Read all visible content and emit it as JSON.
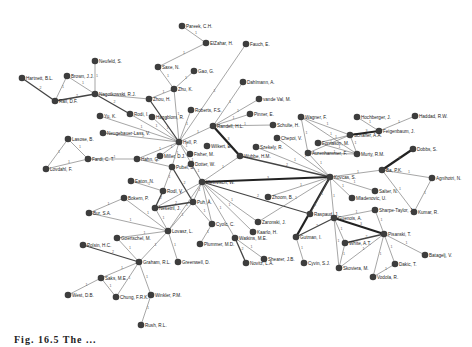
{
  "figure": {
    "caption": "Fig. 16.5  The ..."
  },
  "nodes": [
    {
      "id": "parest",
      "label": "Pareek, C.H.",
      "x": 182,
      "y": 26
    },
    {
      "id": "elzahar",
      "label": "ElZahar, H.",
      "x": 206,
      "y": 43
    },
    {
      "id": "fauch",
      "label": "Fauch, E.",
      "x": 246,
      "y": 44
    },
    {
      "id": "saxe",
      "label": "Saxe, N.",
      "x": 158,
      "y": 67
    },
    {
      "id": "gao",
      "label": "Gao, G.",
      "x": 194,
      "y": 71
    },
    {
      "id": "dahlmann",
      "label": "Dahlmann, A.",
      "x": 243,
      "y": 82
    },
    {
      "id": "vandevall",
      "label": "vande Val, M.",
      "x": 259,
      "y": 99
    },
    {
      "id": "neufeld",
      "label": "Neufeld, S.",
      "x": 95,
      "y": 61
    },
    {
      "id": "hartnett",
      "label": "Hartnett, B.L.",
      "x": 22,
      "y": 78
    },
    {
      "id": "brown",
      "label": "Brown, J.J.",
      "x": 67,
      "y": 76
    },
    {
      "id": "rail",
      "label": "Rail, D.F.",
      "x": 55,
      "y": 101
    },
    {
      "id": "nagoh",
      "label": "Nagotkowski, R.J.",
      "x": 95,
      "y": 94
    },
    {
      "id": "zhu",
      "label": "Zhu, K.",
      "x": 174,
      "y": 89
    },
    {
      "id": "zhou",
      "label": "Zhou, H.",
      "x": 149,
      "y": 99
    },
    {
      "id": "yu",
      "label": "Yu, K.",
      "x": 100,
      "y": 116
    },
    {
      "id": "rodi",
      "label": "Rodi, I.",
      "x": 130,
      "y": 114
    },
    {
      "id": "haggbloom",
      "label": "Haggblom, R.",
      "x": 152,
      "y": 117
    },
    {
      "id": "roberts",
      "label": "Roberts, F.S.",
      "x": 191,
      "y": 110
    },
    {
      "id": "pinner",
      "label": "Pinner, E.",
      "x": 250,
      "y": 114
    },
    {
      "id": "rainbold",
      "label": "Randell, H.L.",
      "x": 213,
      "y": 126
    },
    {
      "id": "schulte",
      "label": "Schulte, H.",
      "x": 273,
      "y": 125
    },
    {
      "id": "wagner",
      "label": "Wagner, F.",
      "x": 301,
      "y": 117
    },
    {
      "id": "hochberger",
      "label": "Hochberger, J.",
      "x": 357,
      "y": 117
    },
    {
      "id": "haddad",
      "label": "Haddad, R.W.",
      "x": 415,
      "y": 116
    },
    {
      "id": "feigenbaum",
      "label": "Feigenbaum, J.",
      "x": 379,
      "y": 131
    },
    {
      "id": "schaffer",
      "label": "Schaffer, A.A.",
      "x": 350,
      "y": 135
    },
    {
      "id": "fornason",
      "label": "Fornason, M.",
      "x": 318,
      "y": 143
    },
    {
      "id": "aurenhammer",
      "label": "Aurenhammer, F.",
      "x": 308,
      "y": 153
    },
    {
      "id": "murty",
      "label": "Murty, R.M.",
      "x": 357,
      "y": 154
    },
    {
      "id": "neugebauer",
      "label": "Neugebauer-Lass, V.",
      "x": 103,
      "y": 133
    },
    {
      "id": "hell",
      "label": "Hell, P.",
      "x": 179,
      "y": 142
    },
    {
      "id": "wilkert",
      "label": "Wilkert, E.",
      "x": 207,
      "y": 146
    },
    {
      "id": "chepoi",
      "label": "Chepoi, V.",
      "x": 277,
      "y": 138
    },
    {
      "id": "lasose",
      "label": "Lasose, B.",
      "x": 68,
      "y": 139
    },
    {
      "id": "fardi",
      "label": "Fardi, C. T.",
      "x": 88,
      "y": 159
    },
    {
      "id": "hahn",
      "label": "Hahn, G.",
      "x": 137,
      "y": 159
    },
    {
      "id": "miller",
      "label": "Miller, D.J.",
      "x": 160,
      "y": 156
    },
    {
      "id": "fisher",
      "label": "Fisher, M.",
      "x": 190,
      "y": 154
    },
    {
      "id": "szekely",
      "label": "Szekely, R.",
      "x": 256,
      "y": 147
    },
    {
      "id": "wubbe",
      "label": "Wubbe, H.M.",
      "x": 240,
      "y": 156
    },
    {
      "id": "lovdahl",
      "label": "Lovdahl, F.",
      "x": 46,
      "y": 169
    },
    {
      "id": "pubel",
      "label": "Pubel, S.",
      "x": 172,
      "y": 167
    },
    {
      "id": "dotter",
      "label": "Dotter, W.",
      "x": 191,
      "y": 164
    },
    {
      "id": "kleinvisch",
      "label": "Kleinvisch, W.",
      "x": 202,
      "y": 182
    },
    {
      "id": "kovcas",
      "label": "Kovcas, S.",
      "x": 330,
      "y": 177
    },
    {
      "id": "ba",
      "label": "Ba, P.K.",
      "x": 382,
      "y": 170
    },
    {
      "id": "dobbs",
      "label": "Dobbs, S.",
      "x": 413,
      "y": 149
    },
    {
      "id": "agnihotri",
      "label": "Agnihotri, N.",
      "x": 432,
      "y": 178
    },
    {
      "id": "salter",
      "label": "Salter, N.",
      "x": 375,
      "y": 191
    },
    {
      "id": "mladenovic",
      "label": "Mladenovic, U.",
      "x": 352,
      "y": 198
    },
    {
      "id": "eaton",
      "label": "Eaton, N.",
      "x": 131,
      "y": 181
    },
    {
      "id": "rodl",
      "label": "Rodl, V.",
      "x": 163,
      "y": 191
    },
    {
      "id": "zhoom",
      "label": "Zhoom, B.",
      "x": 268,
      "y": 197
    },
    {
      "id": "boken",
      "label": "Bokern, P.",
      "x": 124,
      "y": 198
    },
    {
      "id": "puh",
      "label": "Puh, A.",
      "x": 193,
      "y": 202
    },
    {
      "id": "nesetril",
      "label": "Nesetril, J.",
      "x": 155,
      "y": 208
    },
    {
      "id": "raspaud",
      "label": "Raspaud, J.",
      "x": 310,
      "y": 214
    },
    {
      "id": "guenois",
      "label": "Guenois, A.",
      "x": 334,
      "y": 218
    },
    {
      "id": "sharpe",
      "label": "Sharpe-Taylor, J.",
      "x": 375,
      "y": 210
    },
    {
      "id": "kumar",
      "label": "Kumar, R.",
      "x": 414,
      "y": 212
    },
    {
      "id": "bur",
      "label": "Bur, S.A.",
      "x": 89,
      "y": 213
    },
    {
      "id": "lovasz",
      "label": "Lovasz, L.",
      "x": 168,
      "y": 231
    },
    {
      "id": "zaronski",
      "label": "Zaronski, J.",
      "x": 258,
      "y": 222
    },
    {
      "id": "cyolc",
      "label": "Cyolc, C.",
      "x": 212,
      "y": 224
    },
    {
      "id": "kaarlo",
      "label": "Kaarlo, H.",
      "x": 253,
      "y": 232
    },
    {
      "id": "gutman",
      "label": "Gutman, I.",
      "x": 296,
      "y": 237
    },
    {
      "id": "white",
      "label": "White, A.T.",
      "x": 345,
      "y": 243
    },
    {
      "id": "pisanski",
      "label": "Pisanski, T.",
      "x": 384,
      "y": 234
    },
    {
      "id": "goertschel",
      "label": "Goertschel, M.",
      "x": 117,
      "y": 238
    },
    {
      "id": "plummer",
      "label": "Plummer, M.D.",
      "x": 200,
      "y": 244
    },
    {
      "id": "watkins",
      "label": "Watkins, M.E.",
      "x": 235,
      "y": 238
    },
    {
      "id": "polsin",
      "label": "Polsin, H.C.",
      "x": 83,
      "y": 245
    },
    {
      "id": "graham",
      "label": "Graham, R.L.",
      "x": 139,
      "y": 262
    },
    {
      "id": "greenwell",
      "label": "Greenwell, D.",
      "x": 178,
      "y": 262
    },
    {
      "id": "shearer",
      "label": "Shearer, J.B.",
      "x": 264,
      "y": 259
    },
    {
      "id": "cyvin",
      "label": "Cyvin, S.J.",
      "x": 304,
      "y": 263
    },
    {
      "id": "skoviera",
      "label": "Skoviera, M.",
      "x": 339,
      "y": 268
    },
    {
      "id": "dakic",
      "label": "Dakic, T.",
      "x": 395,
      "y": 264
    },
    {
      "id": "batagelj",
      "label": "Batagelj, V.",
      "x": 425,
      "y": 255
    },
    {
      "id": "novitz",
      "label": "Novitz, L.A.",
      "x": 246,
      "y": 263
    },
    {
      "id": "saks",
      "label": "Saks, M.E.",
      "x": 101,
      "y": 278
    },
    {
      "id": "vodola",
      "label": "Vodola, R.",
      "x": 373,
      "y": 277
    },
    {
      "id": "chung",
      "label": "Chung, F.R.K.",
      "x": 116,
      "y": 297
    },
    {
      "id": "winkler",
      "label": "Winkler, P.M.",
      "x": 151,
      "y": 295
    },
    {
      "id": "west",
      "label": "West, D.B.",
      "x": 68,
      "y": 295
    },
    {
      "id": "rush",
      "label": "Rush, R.L.",
      "x": 141,
      "y": 325
    }
  ],
  "edges": [
    [
      "parest",
      "elzahar",
      1,
      "1"
    ],
    [
      "elzahar",
      "saxe",
      1,
      "1"
    ],
    [
      "saxe",
      "zhu",
      1,
      "1"
    ],
    [
      "gao",
      "zhu",
      1,
      "1"
    ],
    [
      "zhu",
      "zhou",
      1,
      "1"
    ],
    [
      "zhu",
      "hell",
      1,
      "1"
    ],
    [
      "zhou",
      "nagoh",
      1,
      "1"
    ],
    [
      "zhou",
      "hell",
      2,
      "2"
    ],
    [
      "neufeld",
      "nagoh",
      1,
      "1"
    ],
    [
      "brown",
      "nagoh",
      1,
      "1"
    ],
    [
      "brown",
      "rail",
      1,
      "1"
    ],
    [
      "hartnett",
      "rail",
      2,
      "2"
    ],
    [
      "rail",
      "nagoh",
      2,
      "2"
    ],
    [
      "nagoh",
      "rodi",
      2,
      "2"
    ],
    [
      "rodi",
      "hell",
      1,
      "1"
    ],
    [
      "yu",
      "hell",
      1,
      "1"
    ],
    [
      "haggbloom",
      "hell",
      1,
      "1"
    ],
    [
      "neugebauer",
      "hell",
      1,
      "1"
    ],
    [
      "roberts",
      "hell",
      1,
      "1"
    ],
    [
      "hell",
      "rainbold",
      1,
      "1"
    ],
    [
      "hell",
      "miller",
      1,
      "1"
    ],
    [
      "hell",
      "fisher",
      1,
      "1"
    ],
    [
      "hell",
      "hahn",
      1,
      "1"
    ],
    [
      "hell",
      "pubel",
      1,
      "1"
    ],
    [
      "hell",
      "kleinvisch",
      1,
      "1"
    ],
    [
      "fauch",
      "hell",
      1,
      "1"
    ],
    [
      "dahlmann",
      "rainbold",
      1,
      "1"
    ],
    [
      "vandevall",
      "rainbold",
      1,
      "1"
    ],
    [
      "pinner",
      "rainbold",
      1,
      "1"
    ],
    [
      "schulte",
      "rainbold",
      1,
      "1"
    ],
    [
      "rainbold",
      "wubbe",
      3,
      "3"
    ],
    [
      "chepoi",
      "kovcas",
      1,
      "1"
    ],
    [
      "szekely",
      "kovcas",
      1,
      "1"
    ],
    [
      "wubbe",
      "kovcas",
      2,
      "2"
    ],
    [
      "lasose",
      "fardi",
      1,
      "1"
    ],
    [
      "lasose",
      "lovdahl",
      1,
      "1"
    ],
    [
      "lovdahl",
      "fardi",
      1,
      "1"
    ],
    [
      "fardi",
      "hahn",
      1,
      "1"
    ],
    [
      "hahn",
      "pubel",
      1,
      "1"
    ],
    [
      "pubel",
      "rodl",
      1,
      "1"
    ],
    [
      "pubel",
      "puh",
      2,
      "2"
    ],
    [
      "dotter",
      "kleinvisch",
      1,
      "1"
    ],
    [
      "kleinvisch",
      "kovcas",
      3,
      "3"
    ],
    [
      "kleinvisch",
      "puh",
      1,
      "1"
    ],
    [
      "kleinvisch",
      "nesetril",
      1,
      "1"
    ],
    [
      "kleinvisch",
      "raspaud",
      2,
      "2"
    ],
    [
      "kleinvisch",
      "cyolc",
      1,
      "1"
    ],
    [
      "kleinvisch",
      "watkins",
      1,
      "1"
    ],
    [
      "kleinvisch",
      "kaarlo",
      1,
      "1"
    ],
    [
      "kleinvisch",
      "zaronski",
      1,
      "1"
    ],
    [
      "kleinvisch",
      "lovasz",
      1,
      "1"
    ],
    [
      "kleinvisch",
      "wubbe",
      1,
      "1"
    ],
    [
      "wagner",
      "schaffer",
      1,
      "1"
    ],
    [
      "wagner",
      "aurenhammer",
      1,
      "1"
    ],
    [
      "wagner",
      "murty",
      1,
      "1"
    ],
    [
      "hochberger",
      "feigenbaum",
      1,
      "1"
    ],
    [
      "haddad",
      "feigenbaum",
      1,
      "1"
    ],
    [
      "schaffer",
      "feigenbaum",
      3,
      "3"
    ],
    [
      "schaffer",
      "fornason",
      1,
      "1"
    ],
    [
      "schaffer",
      "murty",
      1,
      "1"
    ],
    [
      "schaffer",
      "aurenhammer",
      1,
      "1"
    ],
    [
      "fornason",
      "murty",
      1,
      "1"
    ],
    [
      "aurenhammer",
      "kovcas",
      1,
      "1"
    ],
    [
      "aurenhammer",
      "murty",
      1,
      "1"
    ],
    [
      "kovcas",
      "ba",
      1,
      "1"
    ],
    [
      "kovcas",
      "salter",
      1,
      "1"
    ],
    [
      "kovcas",
      "mladenovic",
      1,
      "1"
    ],
    [
      "kovcas",
      "guenois",
      1,
      "1"
    ],
    [
      "kovcas",
      "gutman",
      3,
      "3"
    ],
    [
      "kovcas",
      "zhoom",
      1,
      "1"
    ],
    [
      "kovcas",
      "raspaud",
      1,
      "1"
    ],
    [
      "kovcas",
      "zaronski",
      1,
      "1"
    ],
    [
      "ba",
      "dobbs",
      3,
      "3"
    ],
    [
      "ba",
      "agnihotri",
      1,
      "1"
    ],
    [
      "ba",
      "kumar",
      1,
      "1"
    ],
    [
      "agnihotri",
      "kumar",
      1,
      "1"
    ],
    [
      "guenois",
      "sharpe",
      1,
      "1"
    ],
    [
      "guenois",
      "pisanski",
      3,
      "3"
    ],
    [
      "guenois",
      "gutman",
      2,
      "2"
    ],
    [
      "guenois",
      "white",
      1,
      "1"
    ],
    [
      "guenois",
      "skoviera",
      1,
      "1"
    ],
    [
      "sharpe",
      "pisanski",
      1,
      "1"
    ],
    [
      "white",
      "pisanski",
      2,
      "2"
    ],
    [
      "skoviera",
      "pisanski",
      1,
      "1"
    ],
    [
      "pisanski",
      "dakic",
      1,
      "1"
    ],
    [
      "pisanski",
      "batagelj",
      1,
      "1"
    ],
    [
      "pisanski",
      "vodola",
      1,
      "1"
    ],
    [
      "dakic",
      "vodola",
      1,
      "1"
    ],
    [
      "white",
      "skoviera",
      1,
      "1"
    ],
    [
      "gutman",
      "cyvin",
      1,
      "1"
    ],
    [
      "eaton",
      "rodl",
      1,
      "1"
    ],
    [
      "rodl",
      "nesetril",
      2,
      "2"
    ],
    [
      "nesetril",
      "puh",
      2,
      "2"
    ],
    [
      "nesetril",
      "lovasz",
      1,
      "1"
    ],
    [
      "boken",
      "lovasz",
      1,
      "1"
    ],
    [
      "bur",
      "lovasz",
      1,
      "1"
    ],
    [
      "boken",
      "bur",
      1,
      "1"
    ],
    [
      "goertschel",
      "lovasz",
      1,
      "1"
    ],
    [
      "lovasz",
      "greenwell",
      1,
      "1"
    ],
    [
      "lovasz",
      "graham",
      1,
      "1"
    ],
    [
      "lovasz",
      "puh",
      1,
      "1"
    ],
    [
      "puh",
      "cyolc",
      1,
      "1"
    ],
    [
      "cyolc",
      "plummer",
      1,
      "1"
    ],
    [
      "watkins",
      "novitz",
      2,
      "2"
    ],
    [
      "watkins",
      "shearer",
      1,
      "1"
    ],
    [
      "goertschel",
      "graham",
      1,
      "1"
    ],
    [
      "polsin",
      "graham",
      2,
      "2"
    ],
    [
      "graham",
      "saks",
      1,
      "1"
    ],
    [
      "graham",
      "chung",
      1,
      "1"
    ],
    [
      "saks",
      "chung",
      1,
      "1"
    ],
    [
      "west",
      "saks",
      1,
      "1"
    ],
    [
      "graham",
      "winkler",
      1,
      "1"
    ],
    [
      "winkler",
      "rush",
      1,
      "1"
    ]
  ]
}
